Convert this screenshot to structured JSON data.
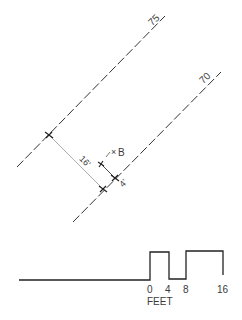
{
  "contours": [
    {
      "label": "75",
      "x1": 17,
      "y1": 167,
      "x2": 165,
      "y2": 16
    },
    {
      "label": "70",
      "x1": 73,
      "y1": 222,
      "x2": 221,
      "y2": 72
    }
  ],
  "markers": {
    "upper": {
      "x": 49,
      "y": 135
    },
    "lower": {
      "x": 103,
      "y": 189
    },
    "inner": {
      "x": 101,
      "y": 164
    },
    "on_70": {
      "x": 115,
      "y": 178
    }
  },
  "dimensions": {
    "long_label": "16'",
    "short_label": "4'"
  },
  "point": {
    "symbol": "×",
    "label": "B"
  },
  "scale_bar": {
    "ticks": [
      "0",
      "4",
      "8",
      "16"
    ],
    "unit": "FEET"
  },
  "colors": {
    "line": "#333333",
    "thin": "#9a9a9a",
    "text": "#3a3a3a"
  }
}
